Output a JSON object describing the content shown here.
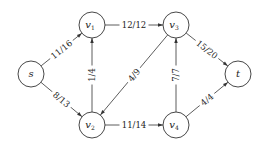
{
  "diagram": {
    "type": "flow-network",
    "nodes": [
      {
        "id": "s",
        "label": "s",
        "sub": "",
        "x": 31,
        "y": 74
      },
      {
        "id": "v1",
        "label": "v",
        "sub": "1",
        "x": 92,
        "y": 25
      },
      {
        "id": "v3",
        "label": "v",
        "sub": "3",
        "x": 176,
        "y": 25
      },
      {
        "id": "t",
        "label": "t",
        "sub": "",
        "x": 238,
        "y": 74
      },
      {
        "id": "v2",
        "label": "v",
        "sub": "2",
        "x": 92,
        "y": 125
      },
      {
        "id": "v4",
        "label": "v",
        "sub": "4",
        "x": 176,
        "y": 125
      }
    ],
    "edges": [
      {
        "from": "s",
        "to": "v1",
        "label": "11/16",
        "flow": 11,
        "capacity": 16
      },
      {
        "from": "s",
        "to": "v2",
        "label": "8/13",
        "flow": 8,
        "capacity": 13
      },
      {
        "from": "v1",
        "to": "v3",
        "label": "12/12",
        "flow": 12,
        "capacity": 12
      },
      {
        "from": "v2",
        "to": "v1",
        "label": "1/4",
        "flow": 1,
        "capacity": 4
      },
      {
        "from": "v3",
        "to": "v2",
        "label": "4/9",
        "flow": 4,
        "capacity": 9
      },
      {
        "from": "v2",
        "to": "v4",
        "label": "11/14",
        "flow": 11,
        "capacity": 14
      },
      {
        "from": "v4",
        "to": "v3",
        "label": "7/7",
        "flow": 7,
        "capacity": 7
      },
      {
        "from": "v3",
        "to": "t",
        "label": "15/20",
        "flow": 15,
        "capacity": 20
      },
      {
        "from": "v4",
        "to": "t",
        "label": "4/4",
        "flow": 4,
        "capacity": 4
      }
    ],
    "colors": {
      "stroke": "#333333",
      "text": "#222222",
      "background": "#ffffff"
    }
  }
}
